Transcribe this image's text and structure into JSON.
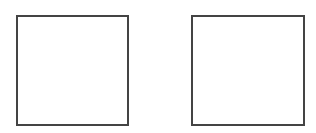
{
  "boxes": [
    {
      "id": "left",
      "x": 16,
      "y": 15,
      "w": 113,
      "h": 111,
      "border": "#444444"
    },
    {
      "id": "right",
      "x": 191,
      "y": 15,
      "w": 114,
      "h": 111,
      "border": "#444444"
    }
  ]
}
